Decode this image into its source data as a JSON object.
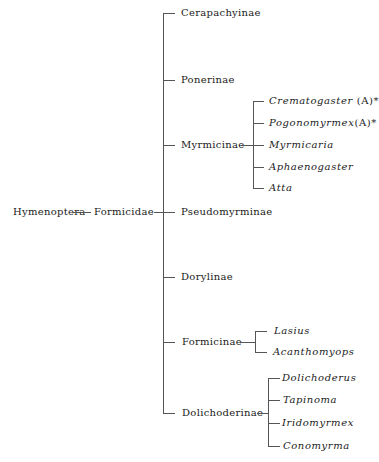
{
  "tree": {
    "order": "Hymenoptera",
    "family": "Formicidae",
    "subfamilies": [
      {
        "name": "Cerapachyinae",
        "genera": []
      },
      {
        "name": "Ponerinae",
        "genera": []
      },
      {
        "name": "Myrmicinae",
        "genera": [
          {
            "name": "Crematogaster",
            "note": "(A)*"
          },
          {
            "name": "Pogonomyrmex",
            "note": "(A)*"
          },
          {
            "name": "Myrmicaria",
            "note": ""
          },
          {
            "name": "Aphaenogaster",
            "note": ""
          },
          {
            "name": "Atta",
            "note": ""
          }
        ]
      },
      {
        "name": "Pseudomyrminae",
        "genera": []
      },
      {
        "name": "Dorylinae",
        "genera": []
      },
      {
        "name": "Formicinae",
        "genera": [
          {
            "name": "Lasius",
            "note": ""
          },
          {
            "name": "Acanthomyops",
            "note": ""
          }
        ]
      },
      {
        "name": "Dolichoderinae",
        "genera": [
          {
            "name": "Dolichoderus",
            "note": ""
          },
          {
            "name": "Tapinoma",
            "note": ""
          },
          {
            "name": "Iridomyrmex",
            "note": ""
          },
          {
            "name": "Conomyrma",
            "note": ""
          }
        ]
      }
    ]
  }
}
